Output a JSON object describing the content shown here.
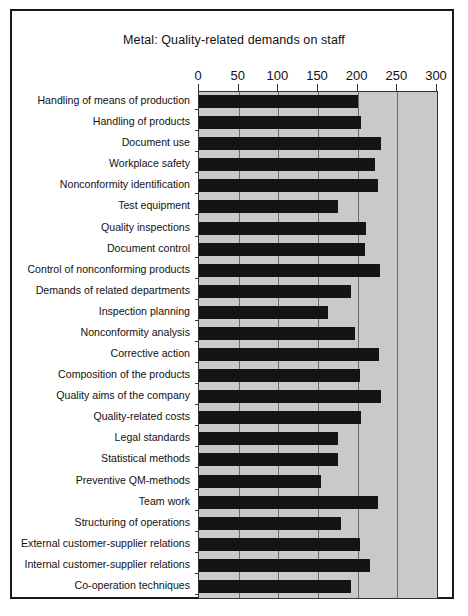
{
  "figure": {
    "title": "Metal: Quality-related demands on staff"
  },
  "axis": {
    "ticks": [
      "0",
      "50",
      "100",
      "150",
      "200",
      "250",
      "300"
    ]
  },
  "colors": {
    "bar": "#141414",
    "plot_background": "#c9c9c9",
    "gridline": "#6a6a6a",
    "frame": "#1a1a1a",
    "text": "#111111"
  },
  "chart_data": {
    "type": "bar",
    "orientation": "horizontal",
    "title": "Metal: Quality-related demands on staff",
    "xlabel": "",
    "ylabel": "",
    "xlim": [
      0,
      300
    ],
    "xticks": [
      0,
      50,
      100,
      150,
      200,
      250,
      300
    ],
    "grid": true,
    "legend": null,
    "categories": [
      "Handling of means of production",
      "Handling of products",
      "Document use",
      "Workplace safety",
      "Nonconformity identification",
      "Test equipment",
      "Quality inspections",
      "Document control",
      "Control of nonconforming products",
      "Demands of related departments",
      "Inspection planning",
      "Nonconformity analysis",
      "Corrective action",
      "Composition of the  products",
      "Quality aims of the company",
      "Quality-related costs",
      "Legal standards",
      "Statistical methods",
      "Preventive QM-methods",
      "Team work",
      "Structuring of operations",
      "External customer-supplier relations",
      "Internal customer-supplier relations",
      "Co-operation techniques"
    ],
    "values": [
      200,
      204,
      229,
      222,
      226,
      175,
      211,
      209,
      228,
      192,
      163,
      197,
      227,
      203,
      229,
      204,
      175,
      175,
      154,
      226,
      179,
      203,
      216,
      192
    ]
  }
}
